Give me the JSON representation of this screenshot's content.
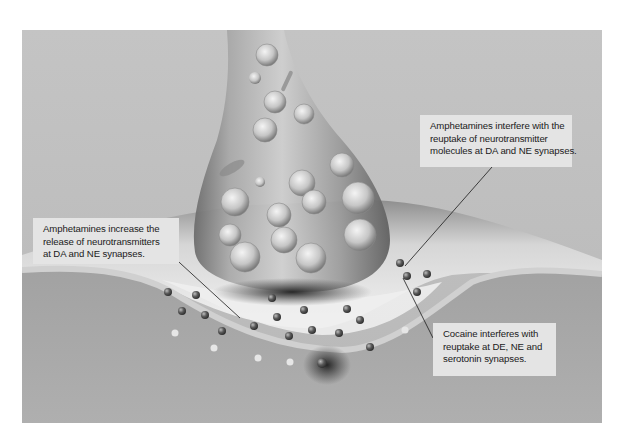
{
  "diagram": {
    "colors": {
      "background": "#bdbdbd",
      "membrane_light": "#e8e8e8",
      "postsynaptic": "#a9a9a9",
      "callout_bg": "#e4e4e4",
      "text": "#1a1a1a"
    },
    "callouts": [
      {
        "id": "amphetamines-reuptake",
        "lines": [
          "Amphetamines interfere with the",
          "reuptake of neurotransmitter",
          "molecules at DA and NE synapses."
        ]
      },
      {
        "id": "amphetamines-release",
        "lines": [
          "Amphetamines increase the",
          "release of neurotransmitters",
          "at DA and NE synapses."
        ]
      },
      {
        "id": "cocaine-reuptake",
        "lines": [
          "Cocaine interferes with",
          "reuptake at DE, NE and",
          "serotonin synapses."
        ]
      }
    ]
  }
}
